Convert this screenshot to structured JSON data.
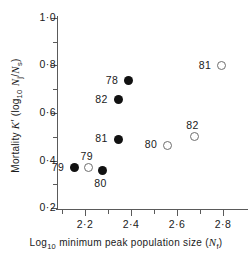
{
  "chart_data": {
    "type": "scatter",
    "title": "",
    "xlabel": "Log10 minimum peak population size (Nf)",
    "ylabel": "Mortality K' (log10 Nj/Ns)",
    "xlim": [
      2.1,
      2.84
    ],
    "ylim": [
      0.18,
      1.02
    ],
    "grid": false,
    "legend": null,
    "x_ticks": [
      "2·2",
      "2·4",
      "2·6",
      "2·8"
    ],
    "x_tick_values": [
      2.2,
      2.4,
      2.6,
      2.8
    ],
    "x_minor_tick_values": [
      2.1,
      2.3,
      2.5,
      2.7
    ],
    "y_ticks": [
      "1·0",
      "0·8",
      "0·6",
      "0·4",
      "0·2"
    ],
    "y_tick_values": [
      1.0,
      0.8,
      0.6,
      0.4,
      0.2
    ],
    "y_minor_tick_values": [
      0.9,
      0.7,
      0.5,
      0.3
    ],
    "series": [
      {
        "name": "filled",
        "marker": "filled-circle",
        "points": [
          {
            "label": "78",
            "x": 2.39,
            "y": 0.735,
            "label_pos": "left"
          },
          {
            "label": "82",
            "x": 2.345,
            "y": 0.655,
            "label_pos": "left"
          },
          {
            "label": "81",
            "x": 2.345,
            "y": 0.49,
            "label_pos": "left"
          },
          {
            "label": "79",
            "x": 2.155,
            "y": 0.37,
            "label_pos": "left"
          },
          {
            "label": "80",
            "x": 2.275,
            "y": 0.357,
            "label_pos": "below"
          }
        ]
      },
      {
        "name": "open",
        "marker": "open-circle",
        "points": [
          {
            "label": "81",
            "x": 2.795,
            "y": 0.8,
            "label_pos": "left"
          },
          {
            "label": "82",
            "x": 2.675,
            "y": 0.5,
            "label_pos": "above"
          },
          {
            "label": "80",
            "x": 2.56,
            "y": 0.465,
            "label_pos": "left"
          },
          {
            "label": "79",
            "x": 2.215,
            "y": 0.37,
            "label_pos": "above"
          }
        ]
      }
    ]
  },
  "axis": {
    "x_title_parts": {
      "prefix": "Log",
      "sub": "10",
      "middle": " minimum peak population size (",
      "var": "N",
      "var_sub": "f",
      "suffix": ")"
    },
    "y_title_parts": {
      "prefix": "Mortality ",
      "var1": "K",
      "prime": "′",
      "mid": " (log",
      "sub1": "10",
      "var2": "N",
      "var2_sub": "j",
      "slash": "/",
      "var3": "N",
      "var3_sub": "s",
      "suffix": ")"
    }
  },
  "colors": {
    "axis": "#5a5a5a",
    "text": "#1a1a1a",
    "filled_marker": "#111111",
    "open_marker_border": "#6e6e6e",
    "background": "#ffffff"
  }
}
